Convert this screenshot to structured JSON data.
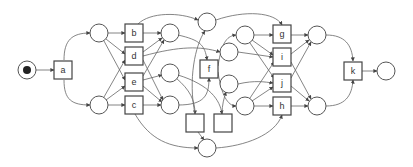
{
  "diagram": {
    "type": "petri-net",
    "transitions": {
      "a": "a",
      "b": "b",
      "c": "c",
      "d": "d",
      "e": "e",
      "f": "f",
      "g": "g",
      "h": "h",
      "i": "i",
      "j": "j",
      "k": "k",
      "t1": "",
      "t2": ""
    },
    "colors": {
      "stroke": "#555555",
      "token": "#222222",
      "background": "#ffffff"
    }
  }
}
